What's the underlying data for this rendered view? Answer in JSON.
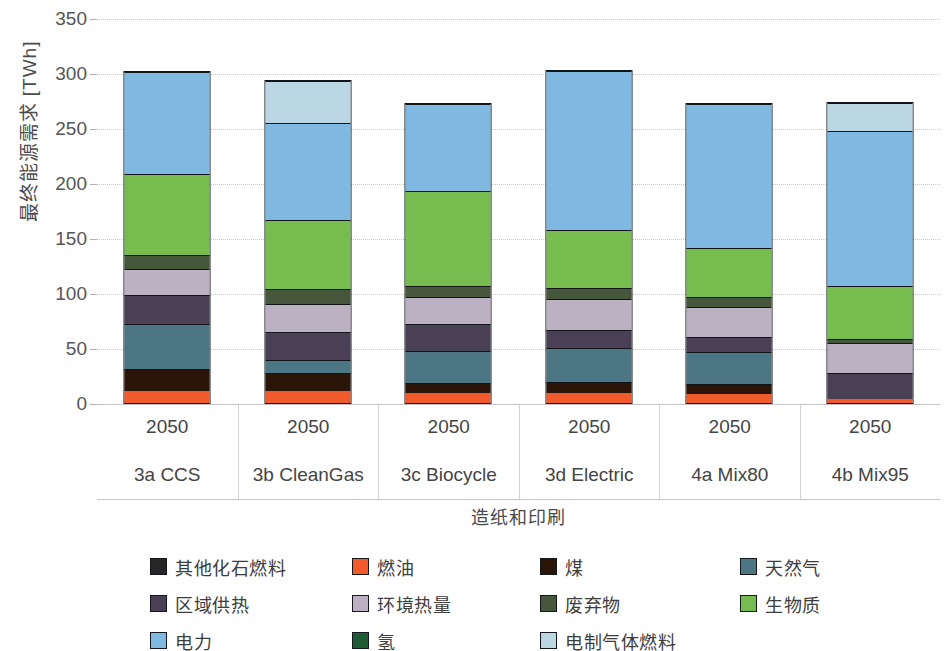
{
  "axis": {
    "y_title": "最终能源需求 [TWh]",
    "y_ticks": [
      "0",
      "50",
      "100",
      "150",
      "200",
      "250",
      "300",
      "350"
    ],
    "group_title": "造纸和印刷"
  },
  "categories": [
    {
      "year": "2050",
      "scenario": "3a CCS"
    },
    {
      "year": "2050",
      "scenario": "3b CleanGas"
    },
    {
      "year": "2050",
      "scenario": "3c Biocycle"
    },
    {
      "year": "2050",
      "scenario": "3d Electric"
    },
    {
      "year": "2050",
      "scenario": "4a Mix80"
    },
    {
      "year": "2050",
      "scenario": "4b Mix95"
    }
  ],
  "legend": [
    [
      {
        "label": "其他化石燃料",
        "color": "#262626",
        "key": "other_fossil"
      },
      {
        "label": "燃油",
        "color": "#F15B2B",
        "key": "fuel_oil"
      },
      {
        "label": "煤",
        "color": "#2A1508",
        "key": "coal"
      },
      {
        "label": "天然气",
        "color": "#4C7683",
        "key": "natural_gas"
      }
    ],
    [
      {
        "label": "区域供热",
        "color": "#4A4055",
        "key": "district_heat"
      },
      {
        "label": "环境热量",
        "color": "#BBB1C2",
        "key": "ambient_heat"
      },
      {
        "label": "废弃物",
        "color": "#46573C",
        "key": "waste"
      },
      {
        "label": "生物质",
        "color": "#77BC4F",
        "key": "biomass"
      }
    ],
    [
      {
        "label": "电力",
        "color": "#7FB8E0",
        "key": "electricity"
      },
      {
        "label": "氢",
        "color": "#1E5B32",
        "key": "hydrogen"
      },
      {
        "label": "电制气体燃料",
        "color": "#BBD7E3",
        "key": "e_gas"
      }
    ]
  ],
  "chart_data": {
    "type": "bar",
    "title": "",
    "subtitle": "",
    "stacked": true,
    "xlabel": "造纸和印刷",
    "ylabel": "最终能源需求 [TWh]",
    "ylim": [
      0,
      350
    ],
    "yticks": [
      0,
      50,
      100,
      150,
      200,
      250,
      300,
      350
    ],
    "grid": true,
    "legend_position": "bottom",
    "categories": [
      "3a CCS",
      "3b CleanGas",
      "3c Biocycle",
      "3d Electric",
      "4a Mix80",
      "4b Mix95"
    ],
    "category_years": [
      "2050",
      "2050",
      "2050",
      "2050",
      "2050",
      "2050"
    ],
    "series": [
      {
        "name": "燃油",
        "color": "#F15B2B",
        "values": [
          11,
          11,
          9,
          9,
          8,
          4
        ]
      },
      {
        "name": "煤",
        "color": "#2A1508",
        "values": [
          20,
          16,
          9,
          10,
          9,
          0
        ]
      },
      {
        "name": "天然气",
        "color": "#4C7683",
        "values": [
          41,
          12,
          29,
          31,
          29,
          0
        ]
      },
      {
        "name": "区域供热",
        "color": "#4A4055",
        "values": [
          26,
          26,
          25,
          16,
          14,
          23
        ]
      },
      {
        "name": "环境热量",
        "color": "#BBB1C2",
        "values": [
          24,
          25,
          24,
          29,
          27,
          28
        ]
      },
      {
        "name": "废弃物",
        "color": "#46573C",
        "values": [
          13,
          14,
          10,
          10,
          9,
          3
        ]
      },
      {
        "name": "生物质",
        "color": "#77BC4F",
        "values": [
          73,
          62,
          87,
          52,
          45,
          48
        ]
      },
      {
        "name": "电力",
        "color": "#7FB8E0",
        "values": [
          93,
          89,
          79,
          145,
          131,
          141
        ]
      },
      {
        "name": "氢",
        "color": "#1E5B32",
        "values": [
          0,
          0,
          0,
          0,
          0,
          0
        ]
      },
      {
        "name": "电制气体燃料",
        "color": "#BBD7E3",
        "values": [
          0,
          38,
          0,
          0,
          0,
          26
        ]
      }
    ],
    "totals": [
      301,
      293,
      272,
      302,
      272,
      273
    ]
  }
}
